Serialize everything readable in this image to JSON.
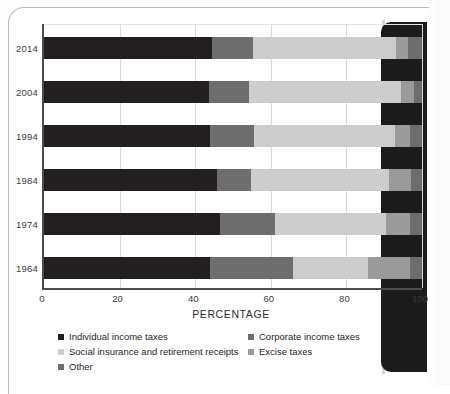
{
  "page": {
    "kind": "scanned-book-page",
    "spine_color": "#1b1b1b",
    "sheet_color": "#ffffff"
  },
  "chart_data": {
    "type": "bar",
    "subtype": "stacked-horizontal-100-percent",
    "title": "",
    "xlabel": "PERCENTAGE",
    "ylabel": "",
    "xlim": [
      0,
      100
    ],
    "xticks": [
      0,
      20,
      40,
      60,
      80,
      100
    ],
    "xtick_labels": [
      "0",
      "20",
      "40",
      "60",
      "80",
      "100"
    ],
    "grid": true,
    "grid_axis": "x",
    "legend_position": "below",
    "categories": [
      "2014",
      "2004",
      "1994",
      "1984",
      "1974",
      "1964"
    ],
    "series": [
      {
        "name": "Individual income taxes",
        "color": "#231f20",
        "values": [
          44.4,
          43.7,
          43.9,
          45.8,
          46.6,
          44.0
        ]
      },
      {
        "name": "Corporate income taxes",
        "color": "#6d6d6d",
        "values": [
          10.8,
          10.5,
          11.7,
          9.0,
          14.5,
          21.9
        ]
      },
      {
        "name": "Social insurance and retirement receipts",
        "color": "#cdcdcd",
        "values": [
          38.0,
          40.2,
          37.2,
          36.5,
          29.4,
          19.8
        ]
      },
      {
        "name": "Excise taxes",
        "color": "#9a9a9a",
        "values": [
          3.1,
          3.4,
          4.0,
          5.8,
          6.4,
          11.1
        ]
      },
      {
        "name": "Other",
        "color": "#6d6d6d",
        "values": [
          3.7,
          2.2,
          3.2,
          2.9,
          3.1,
          3.2
        ]
      }
    ]
  },
  "axis": {
    "x_title": "PERCENTAGE",
    "x_tick_labels": [
      "0",
      "20",
      "40",
      "60",
      "80",
      "100"
    ],
    "y_tick_labels": [
      "2014",
      "2004",
      "1994",
      "1984",
      "1974",
      "1964"
    ]
  },
  "legend": {
    "items": [
      {
        "label": "Individual income taxes",
        "color": "#231f20"
      },
      {
        "label": "Social insurance and retirement receipts",
        "color": "#cdcdcd"
      },
      {
        "label": "Other",
        "color": "#6d6d6d"
      },
      {
        "label": "Corporate income taxes",
        "color": "#6d6d6d"
      },
      {
        "label": "Excise taxes",
        "color": "#9a9a9a"
      }
    ]
  }
}
